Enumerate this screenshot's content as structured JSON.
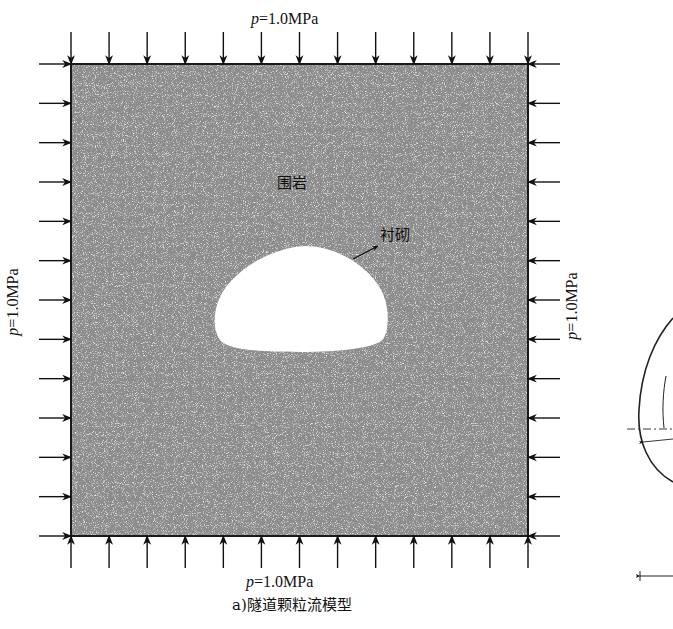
{
  "figure": {
    "caption": "a)隧道颗粒流模型",
    "pressure": {
      "symbol": "p",
      "value_text": "=1.0MPa",
      "value_mpa": 1.0,
      "top_label": "p=1.0MPa",
      "bottom_label": "p=1.0MPa",
      "left_label": "p=1.0MPa",
      "right_label": "p=1.0MPa",
      "arrows_per_side": 13
    },
    "regions": {
      "surrounding_rock": "围岩",
      "lining": "衬砌"
    },
    "domain_box": {
      "x": 71,
      "y": 64,
      "width": 457,
      "height": 472
    },
    "tunnel": {
      "x_left": 213,
      "x_right": 387,
      "y_top": 245,
      "y_bottom": 352
    },
    "colors": {
      "rock_fill": "#8c8c8c",
      "border": "#1a1a1a",
      "tunnel_fill": "#ffffff",
      "text": "#111111"
    }
  }
}
